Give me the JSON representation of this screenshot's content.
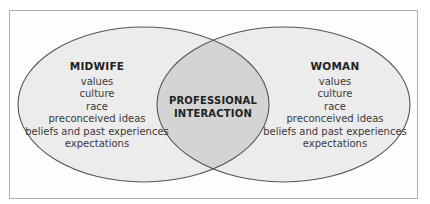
{
  "diagram": {
    "type": "venn",
    "colors": {
      "frame_border": "#b0b0b0",
      "ellipse_fill": "#ececec",
      "overlap_fill": "#d4d4d4",
      "ellipse_stroke": "#555555",
      "text": "#333333"
    },
    "left": {
      "title": "MIDWIFE",
      "items": [
        "values",
        "culture",
        "race",
        "preconceived ideas",
        "beliefs and past experiences",
        "expectations"
      ]
    },
    "right": {
      "title": "WOMAN",
      "items": [
        "values",
        "culture",
        "race",
        "preconceived ideas",
        "beliefs and past experiences",
        "expectations"
      ]
    },
    "overlap": {
      "line1": "PROFESSIONAL",
      "line2": "INTERACTION"
    }
  }
}
